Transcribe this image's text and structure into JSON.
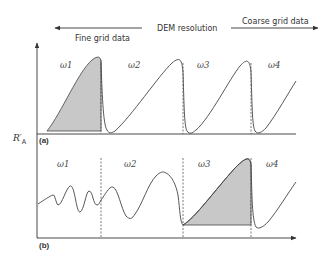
{
  "header": {
    "center_label": "DEM resolution",
    "left_label": "Fine grid data",
    "right_label": "Coarse grid data"
  },
  "axis": {
    "y_label_main": "R′",
    "y_label_sub": "A"
  },
  "panels": [
    {
      "tag": "(a)",
      "windows": [
        "ω1",
        "ω2",
        "ω3",
        "ω4"
      ],
      "shaded_window": "ω1"
    },
    {
      "tag": "(b)",
      "windows": [
        "ω1",
        "ω2",
        "ω3",
        "ω4"
      ],
      "shaded_window": "ω3"
    }
  ],
  "colors": {
    "shade": "#c8c8c8",
    "line": "#444444",
    "axis": "#333333"
  }
}
